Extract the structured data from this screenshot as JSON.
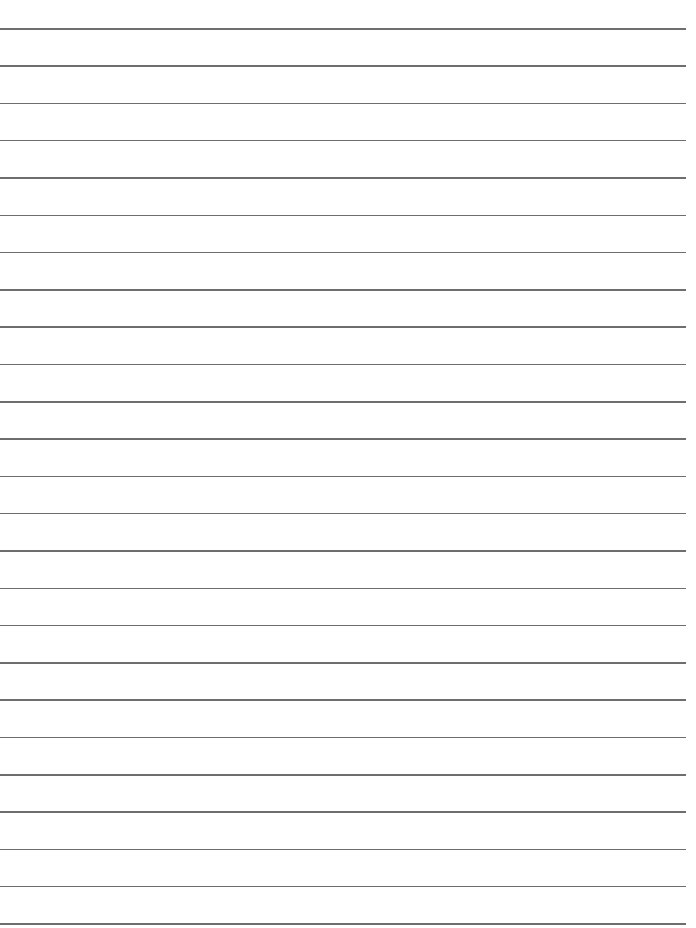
{
  "page": {
    "type": "lined-paper",
    "background_color": "#ffffff",
    "line_color": "#6e6e6e",
    "line_count": 25,
    "first_line_y": 28,
    "line_spacing": 37.3,
    "line_right_edge": 686,
    "text": ""
  }
}
